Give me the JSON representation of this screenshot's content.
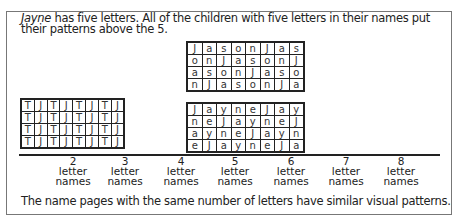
{
  "intro": {
    "name": "Jayne",
    "text": " has five letters.  All of the children with five letters in their names put their patterns above the 5."
  },
  "grids": {
    "jason": [
      [
        "J",
        "a",
        "s",
        "o",
        "n",
        "J",
        "a",
        "s"
      ],
      [
        "o",
        "n",
        "J",
        "a",
        "s",
        "o",
        "n",
        "J"
      ],
      [
        "a",
        "s",
        "o",
        "n",
        "J",
        "a",
        "s",
        "o"
      ],
      [
        "n",
        "J",
        "a",
        "s",
        "o",
        "n",
        "J",
        "a"
      ]
    ],
    "jayne": [
      [
        "J",
        "a",
        "y",
        "n",
        "e",
        "J",
        "a",
        "y"
      ],
      [
        "n",
        "e",
        "J",
        "a",
        "y",
        "n",
        "e",
        "J"
      ],
      [
        "a",
        "y",
        "n",
        "e",
        "J",
        "a",
        "y",
        "n"
      ],
      [
        "e",
        "J",
        "a",
        "y",
        "n",
        "e",
        "J",
        "a"
      ]
    ],
    "tj": [
      [
        "T",
        "J",
        "T",
        "J",
        "T",
        "J",
        "T",
        "J"
      ],
      [
        "T",
        "J",
        "T",
        "J",
        "T",
        "J",
        "T",
        "J"
      ],
      [
        "T",
        "J",
        "T",
        "J",
        "T",
        "J",
        "T",
        "J"
      ],
      [
        "T",
        "J",
        "T",
        "J",
        "T",
        "J",
        "T",
        "J"
      ]
    ]
  },
  "axis": {
    "labels": [
      {
        "num": "2",
        "line1": "letter",
        "line2": "names"
      },
      {
        "num": "3",
        "line1": "letter",
        "line2": "names"
      },
      {
        "num": "4",
        "line1": "letter",
        "line2": "names"
      },
      {
        "num": "5",
        "line1": "letter",
        "line2": "names"
      },
      {
        "num": "6",
        "line1": "letter",
        "line2": "names"
      },
      {
        "num": "7",
        "line1": "letter",
        "line2": "names"
      },
      {
        "num": "8",
        "line1": "letter",
        "line2": "names"
      }
    ]
  },
  "footer": "The name pages with the same number of letters have similar visual patterns."
}
